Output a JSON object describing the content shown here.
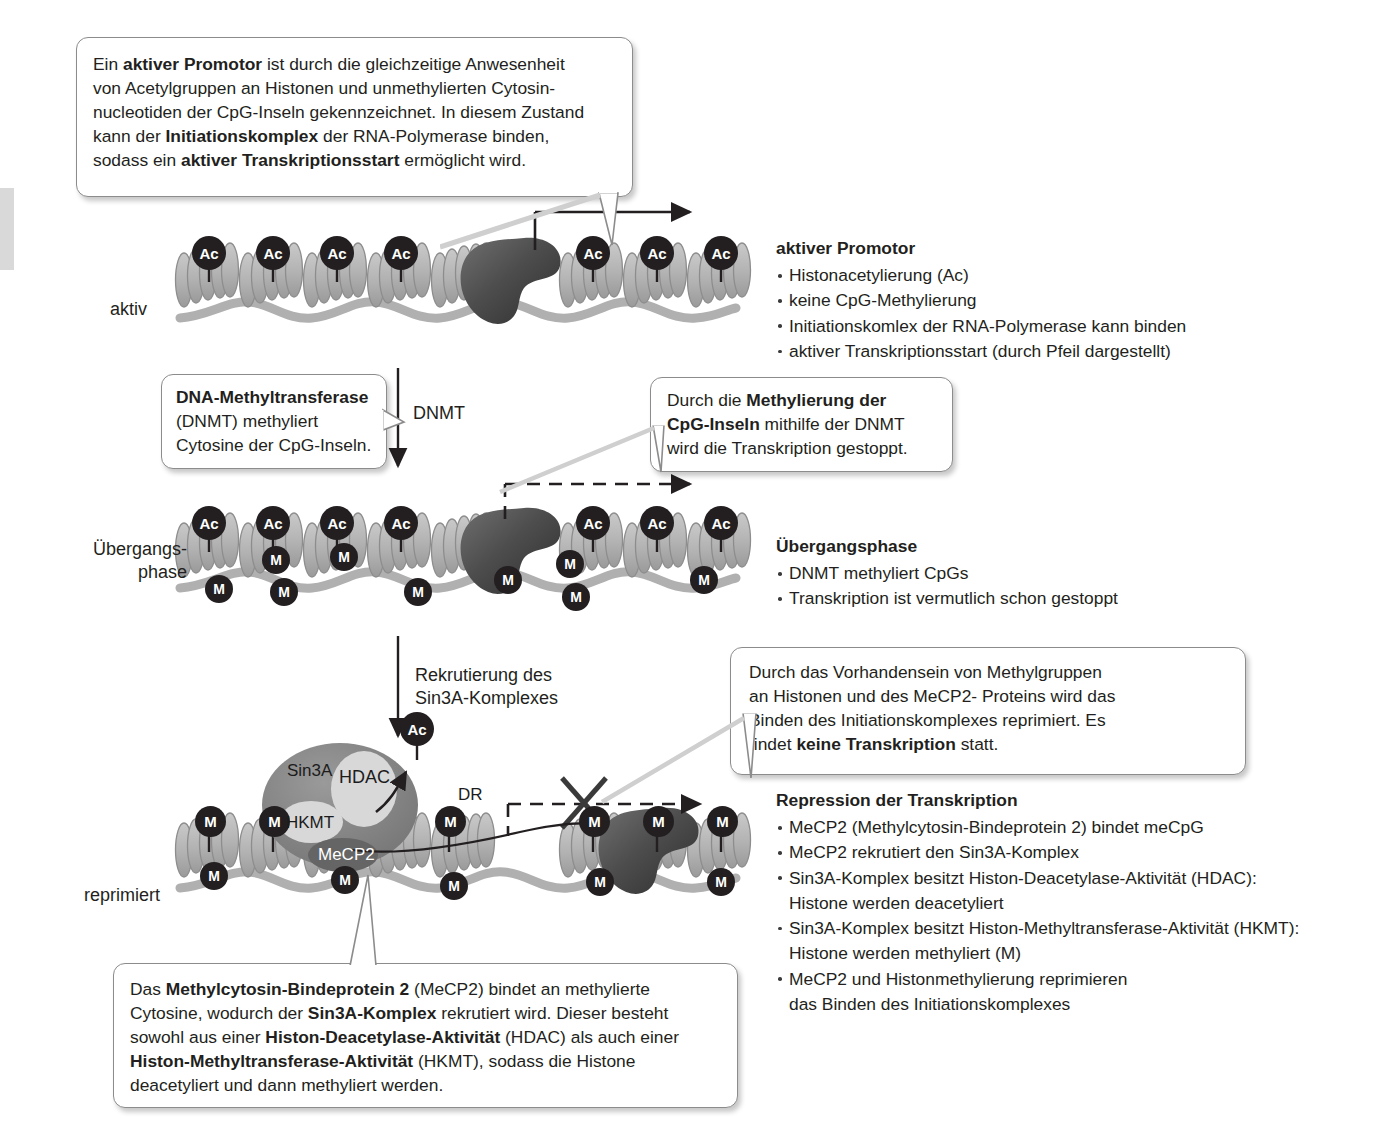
{
  "figure": {
    "language": "de"
  },
  "colors": {
    "nucleosome": "#b3b3b3",
    "nucleosome_edge": "#8a8a8a",
    "dna": "#b0b0b0",
    "polymerase": "#5a5a5a",
    "tag_fill": "#231f20",
    "tag_text": "#ffffff",
    "sin3a_body": "#7d7d7d",
    "hdac_fill": "#d6d6d6",
    "hkmt_fill": "#d6d6d6",
    "mecp2_fill": "#6b6b6b",
    "bubble_border": "#8c8c8c",
    "text": "#231f20"
  },
  "callouts": {
    "active_promoter": {
      "name": "active-promoter-callout",
      "lines": [
        [
          {
            "t": "Ein ",
            "b": false
          },
          {
            "t": "aktiver Promotor",
            "b": true
          },
          {
            "t": " ist durch die gleichzeitige Anwesenheit",
            "b": false
          }
        ],
        [
          {
            "t": "von Acetylgruppen an Histonen und unmethylierten Cytosin-",
            "b": false
          }
        ],
        [
          {
            "t": "nucleotiden der CpG-Inseln gekennzeichnet. In diesem Zustand",
            "b": false
          }
        ],
        [
          {
            "t": "kann der ",
            "b": false
          },
          {
            "t": "Initiationskomplex",
            "b": true
          },
          {
            "t": " der RNA-Polymerase binden,",
            "b": false
          }
        ],
        [
          {
            "t": "sodass ein ",
            "b": false
          },
          {
            "t": "aktiver Transkriptionsstart",
            "b": true
          },
          {
            "t": " ermöglicht wird.",
            "b": false
          }
        ]
      ]
    },
    "dnmt": {
      "name": "dnmt-callout",
      "lines": [
        [
          {
            "t": "DNA-Methyltransferase",
            "b": true
          }
        ],
        [
          {
            "t": "(DNMT) methyliert",
            "b": false
          }
        ],
        [
          {
            "t": "Cytosine der CpG-Inseln.",
            "b": false
          }
        ]
      ]
    },
    "methylation_stop": {
      "name": "methylation-stop-callout",
      "lines": [
        [
          {
            "t": "Durch die ",
            "b": false
          },
          {
            "t": "Methylierung der",
            "b": true
          }
        ],
        [
          {
            "t": "CpG-Inseln",
            "b": true
          },
          {
            "t": " mithilfe der DNMT",
            "b": false
          }
        ],
        [
          {
            "t": "wird die Transkription gestoppt.",
            "b": false
          }
        ]
      ]
    },
    "repression": {
      "name": "repression-callout",
      "lines": [
        [
          {
            "t": "Durch das Vorhandensein von Methylgruppen",
            "b": false
          }
        ],
        [
          {
            "t": "an Histonen und des MeCP2- Proteins wird das",
            "b": false
          }
        ],
        [
          {
            "t": "Binden des Initiationskomplexes reprimiert. Es",
            "b": false
          }
        ],
        [
          {
            "t": "findet ",
            "b": false
          },
          {
            "t": "keine Transkription",
            "b": true
          },
          {
            "t": " statt.",
            "b": false
          }
        ]
      ]
    },
    "mecp2": {
      "name": "mecp2-callout",
      "lines": [
        [
          {
            "t": "Das ",
            "b": false
          },
          {
            "t": "Methylcytosin-Bindeprotein 2",
            "b": true
          },
          {
            "t": " (MeCP2) bindet an methylierte",
            "b": false
          }
        ],
        [
          {
            "t": "Cytosine, wodurch der ",
            "b": false
          },
          {
            "t": "Sin3A-Komplex",
            "b": true
          },
          {
            "t": " rekrutiert wird.  Dieser besteht",
            "b": false
          }
        ],
        [
          {
            "t": "sowohl aus einer ",
            "b": false
          },
          {
            "t": "Histon-Deacetylase-Aktivität",
            "b": true
          },
          {
            "t": " (HDAC) als auch einer",
            "b": false
          }
        ],
        [
          {
            "t": "Histon-Methyltransferase-Aktivität",
            "b": true
          },
          {
            "t": " (HKMT), sodass die Histone",
            "b": false
          }
        ],
        [
          {
            "t": "deacetyliert und dann methyliert werden.",
            "b": false
          }
        ]
      ]
    }
  },
  "legends": {
    "active": {
      "title": "aktiver Promotor",
      "items": [
        "Histonacetylierung (Ac)",
        "keine CpG-Methylierung",
        "Initiationskomlex der RNA-Polymerase kann binden",
        "aktiver Transkriptionsstart (durch Pfeil dargestellt)"
      ]
    },
    "transition": {
      "title": "Übergangsphase",
      "items": [
        "DNMT methyliert CpGs",
        "Transkription ist vermutlich schon gestoppt"
      ]
    },
    "repressed": {
      "title": "Repression der Transkription",
      "items": [
        "MeCP2 (Methylcytosin-Bindeprotein 2) bindet meCpG",
        "MeCP2 rekrutiert den Sin3A-Komplex",
        "Sin3A-Komplex besitzt Histon-Deacetylase-Aktivität (HDAC):",
        "Histone werden deacetyliert",
        "Sin3A-Komplex besitzt Histon-Methyltransferase-Aktivität (HKMT):",
        "Histone werden methyliert (M)",
        "MeCP2 und Histonmethylierung reprimieren",
        "das Binden des Initiationskomplexes"
      ],
      "continuation_flags": [
        false,
        false,
        false,
        true,
        false,
        true,
        false,
        true
      ]
    }
  },
  "row_labels": {
    "active": "aktiv",
    "transition_line1": "Übergangs-",
    "transition_line2": "phase",
    "repressed": "reprimiert"
  },
  "arrow_labels": {
    "dnmt": "DNMT",
    "recruitment_line1": "Rekrutierung des",
    "recruitment_line2": "Sin3A-Komplexes"
  },
  "complex_labels": {
    "sin3a": "Sin3A",
    "hdac": "HDAC",
    "hkmt": "HKMT",
    "mecp2": "MeCP2",
    "dr": "DR",
    "ac_released": "Ac"
  },
  "marks": {
    "acetyl": "Ac",
    "methyl": "M"
  },
  "chromatin": {
    "active_row": {
      "nucleosome_count": 7,
      "ac_tags": 7,
      "m_tags": 0,
      "polymerase": true,
      "transcription_arrow": "solid"
    },
    "transition_row": {
      "nucleosome_count": 7,
      "ac_tags": 7,
      "m_tags": 9,
      "polymerase": true,
      "transcription_arrow": "dashed"
    },
    "repressed_row": {
      "nucleosome_count": 7,
      "ac_tags": 0,
      "m_tags": 11,
      "polymerase": true,
      "transcription_arrow": "dashed-blocked",
      "blocked_mark": "X"
    }
  }
}
